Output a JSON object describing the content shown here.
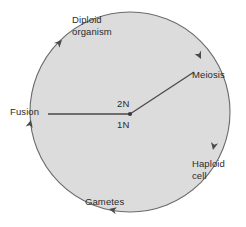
{
  "diagram": {
    "type": "cycle-diagram",
    "colors": {
      "background": "#ffffff",
      "circle_fill": "#dcdcdc",
      "stroke": "#5a5a5a",
      "text": "#2b2b2b"
    },
    "circle": {
      "center_x": 130,
      "center_y": 112,
      "radius": 100
    },
    "center_point": {
      "x": 130,
      "y": 114,
      "upper_label": "2N",
      "lower_label": "1N"
    },
    "labels": {
      "diploid_organism": "Diploid\norganism",
      "meiosis": "Meiosis",
      "haploid_cell": "Haploid\ncell",
      "gametes": "Gametes",
      "fusion": "Fusion",
      "ploidy_diploid": "2N",
      "ploidy_haploid": "1N"
    },
    "arrows": [
      {
        "name": "arrow-upper-left",
        "x": 62,
        "y": 40,
        "rotation": -45,
        "direction": "clockwise"
      },
      {
        "name": "arrow-upper-right",
        "x": 200,
        "y": 58,
        "rotation": 130,
        "direction": "clockwise"
      },
      {
        "name": "arrow-right",
        "x": 213,
        "y": 148,
        "rotation": 168,
        "direction": "clockwise"
      },
      {
        "name": "arrow-bottom",
        "x": 110,
        "y": 208,
        "rotation": 260,
        "direction": "clockwise"
      },
      {
        "name": "arrow-left",
        "x": 31,
        "y": 122,
        "rotation": -10,
        "direction": "clockwise"
      }
    ],
    "radial_lines": [
      {
        "name": "line-to-meiosis",
        "from_x": 130,
        "from_y": 114,
        "to_x": 194,
        "to_y": 72
      },
      {
        "name": "line-to-fusion",
        "from_x": 130,
        "from_y": 114,
        "to_x": 48,
        "to_y": 114
      }
    ]
  }
}
